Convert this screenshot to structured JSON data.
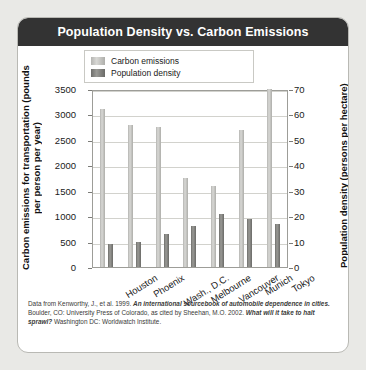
{
  "card": {
    "title": "Population Density vs. Carbon Emissions"
  },
  "legend": {
    "items": [
      {
        "label": "Carbon emissions",
        "color": "#c9c9c6"
      },
      {
        "label": "Population density",
        "color": "#7d7d79"
      }
    ]
  },
  "caption": {
    "part1": "Data from Kenworthy, J., et al. 1999. ",
    "em1": "An international sourcebook of automobile dependence in cities.",
    "part2": " Boulder, CO: University Press of Colorado, as cited by Sheehan, M.O. 2002. ",
    "em2": "What will it take to halt sprawl?",
    "part3": " Washington DC: Worldwatch Institute."
  },
  "chart_data": {
    "type": "bar",
    "title": "Population Density vs. Carbon Emissions",
    "xlabel": "",
    "categories": [
      "Houston",
      "Phoenix",
      "Wash., D.C.",
      "Melbourne",
      "Vancouver",
      "Munich",
      "Tokyo"
    ],
    "grid": true,
    "legend_position": "top-left",
    "series": [
      {
        "name": "Carbon emissions",
        "axis": "left",
        "unit": "pounds per person per year",
        "values": [
          3100,
          2800,
          2750,
          1750,
          1600,
          2700,
          3500
        ]
      },
      {
        "name": "Population density",
        "axis": "right",
        "unit": "persons per hectare",
        "values": [
          9,
          10,
          13,
          16,
          21,
          19,
          17
        ]
      }
    ],
    "axes": {
      "left": {
        "label": "Carbon emissions for transportation (pounds per person per year)",
        "ticks": [
          0,
          500,
          1000,
          1500,
          2000,
          2500,
          3000,
          3500
        ],
        "lim": [
          0,
          3500
        ]
      },
      "right": {
        "label": "Population density (persons per hectare)",
        "ticks": [
          0,
          10,
          20,
          30,
          40,
          50,
          60,
          70
        ],
        "lim": [
          0,
          70
        ]
      }
    }
  }
}
